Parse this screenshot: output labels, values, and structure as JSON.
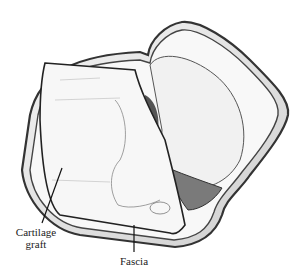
{
  "figure": {
    "type": "medical illustration",
    "labels": [
      {
        "id": "cartilage-graft",
        "text_line1": "Cartilage",
        "text_line2": "graft"
      },
      {
        "id": "fascia",
        "text": "Fascia"
      }
    ]
  }
}
